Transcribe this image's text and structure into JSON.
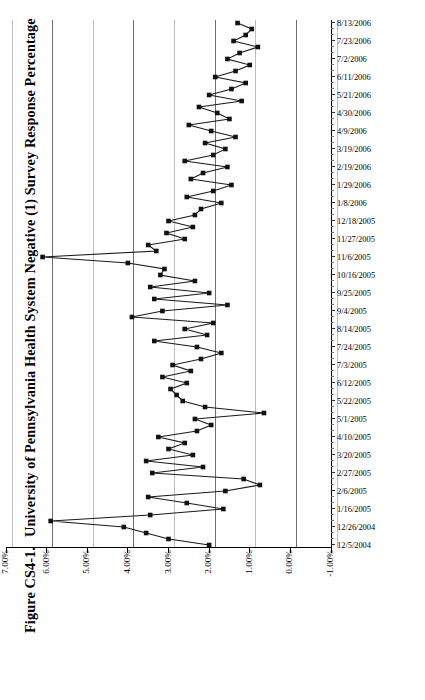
{
  "figure": {
    "number": "Figure CS4-1.",
    "title": "University of Pennsylvania Health System Negative (1) Survey Response Percentage"
  },
  "chart_data": {
    "type": "line",
    "title": "University of Pennsylvania Health System Negative (1) Survey Response Percentage",
    "orientation": "rotated-90",
    "xlabel": "",
    "ylabel": "",
    "grid": true,
    "legend": null,
    "ylim": [
      -1.0,
      7.0
    ],
    "ytick_labels": [
      "7.00%",
      "6.00%",
      "5.00%",
      "4.00%",
      "3.00%",
      "2.00%",
      "1.00%",
      "0.00%",
      "-1.00%"
    ],
    "ytick_values": [
      7.0,
      6.0,
      5.0,
      4.0,
      3.0,
      2.0,
      1.0,
      0.0,
      -1.0
    ],
    "xtick_labels": [
      "12/5/2004",
      "12/26/2004",
      "1/16/2005",
      "2/6/2005",
      "2/27/2005",
      "3/20/2005",
      "4/10/2005",
      "5/1/2005",
      "5/22/2005",
      "6/12/2005",
      "7/3/2005",
      "7/24/2005",
      "8/14/2005",
      "9/4/2005",
      "9/25/2005",
      "10/16/2005",
      "11/6/2005",
      "11/27/2005",
      "12/18/2005",
      "1/8/2006",
      "1/29/2006",
      "2/19/2006",
      "3/19/2006",
      "4/9/2006",
      "4/30/2006",
      "5/21/2006",
      "6/11/2006",
      "7/2/2006",
      "7/23/2006",
      "8/13/2006",
      "9/3/2006",
      "9/24/2006"
    ],
    "xtick_label_every": 3,
    "series": [
      {
        "name": "Negative (1) Survey Response Percentage",
        "marker": "square",
        "color": "#111111",
        "values": [
          2.0,
          3.0,
          3.55,
          4.1,
          5.9,
          3.45,
          1.65,
          2.55,
          3.5,
          1.6,
          0.75,
          1.15,
          3.4,
          2.15,
          3.55,
          2.4,
          3.0,
          2.6,
          3.25,
          2.3,
          1.95,
          2.35,
          0.65,
          2.1,
          2.65,
          2.8,
          2.95,
          2.55,
          3.15,
          2.45,
          2.9,
          2.2,
          1.7,
          2.3,
          3.35,
          2.05,
          2.6,
          1.9,
          3.9,
          3.15,
          1.55,
          3.35,
          2.0,
          3.45,
          2.35,
          3.2,
          3.1,
          4.0,
          6.1,
          3.3,
          3.5,
          2.6,
          3.05,
          2.4,
          3.0,
          2.35,
          2.2,
          1.7,
          2.55,
          1.9,
          1.45,
          2.45,
          2.15,
          1.55,
          2.6,
          1.9,
          1.6,
          2.1,
          1.35,
          1.95,
          2.5,
          1.5,
          1.8,
          2.25,
          1.2,
          2.0,
          1.45,
          1.1,
          1.85,
          1.35,
          1.0,
          1.55,
          1.25,
          0.8,
          1.4,
          1.1,
          0.95,
          1.3
        ]
      }
    ]
  },
  "axes": {
    "value_axis_name": "value-axis",
    "category_axis_name": "date-axis"
  }
}
